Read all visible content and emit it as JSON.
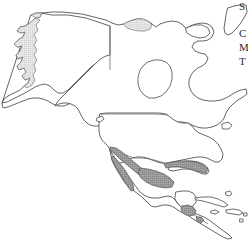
{
  "figure": {
    "kind": "distribution-range-map",
    "region": "North America",
    "background_color": "#ffffff",
    "width": 248,
    "height": 240
  },
  "colors": {
    "ocean": "#ffffff",
    "land_fill": "#ffffff",
    "coastline_stroke": "#4a4a4a",
    "border_stroke": "#6a6a6a",
    "range_main_fill": "#969696",
    "range_light_fill": "#e0e0e0",
    "text": "#2b2b2b"
  },
  "layers": {
    "landmasses": [
      {
        "name": "alaska-mainland",
        "label": "Alaska"
      },
      {
        "name": "canada-mainland",
        "label": "Canada"
      },
      {
        "name": "united-states-mainland",
        "label": "United States"
      },
      {
        "name": "mexico-mainland",
        "label": "Mexico"
      },
      {
        "name": "central-america",
        "label": "Central America"
      },
      {
        "name": "greenland-edge",
        "label": "Greenland"
      },
      {
        "name": "caribbean-islands",
        "label": "Caribbean Islands"
      }
    ],
    "borders": [
      {
        "name": "alaska-yukon-border",
        "label": "Alaska / Yukon border"
      },
      {
        "name": "usa-canada-49th-parallel",
        "label": "United States / Canada border"
      },
      {
        "name": "usa-mexico-border",
        "label": "United States / Mexico border"
      },
      {
        "name": "mexico-guatemala-border",
        "label": "Mexico / Guatemala border"
      }
    ],
    "shaded_ranges": [
      {
        "name": "range-baja-california",
        "label": "Baja California",
        "shade": "main"
      },
      {
        "name": "range-sierra-madre-occidental",
        "label": "Sierra Madre Occidental",
        "shade": "main"
      },
      {
        "name": "range-central-mexico",
        "label": "Central Mexican Plateau",
        "shade": "main"
      },
      {
        "name": "range-gulf-coast-strip",
        "label": "Gulf Coast strip",
        "shade": "main"
      },
      {
        "name": "range-central-america-patch",
        "label": "Guatemala / Honduras highlands",
        "shade": "main"
      },
      {
        "name": "range-alaska-panhandle",
        "label": "Alaska southern coast",
        "shade": "light"
      },
      {
        "name": "range-northern-canada-patch",
        "label": "Northern Canada coast",
        "shade": "light"
      }
    ]
  },
  "edge_text": {
    "note": "Text column clipped at the right edge of the screenshot",
    "lines": [
      "S",
      "C",
      "M",
      "T"
    ]
  }
}
